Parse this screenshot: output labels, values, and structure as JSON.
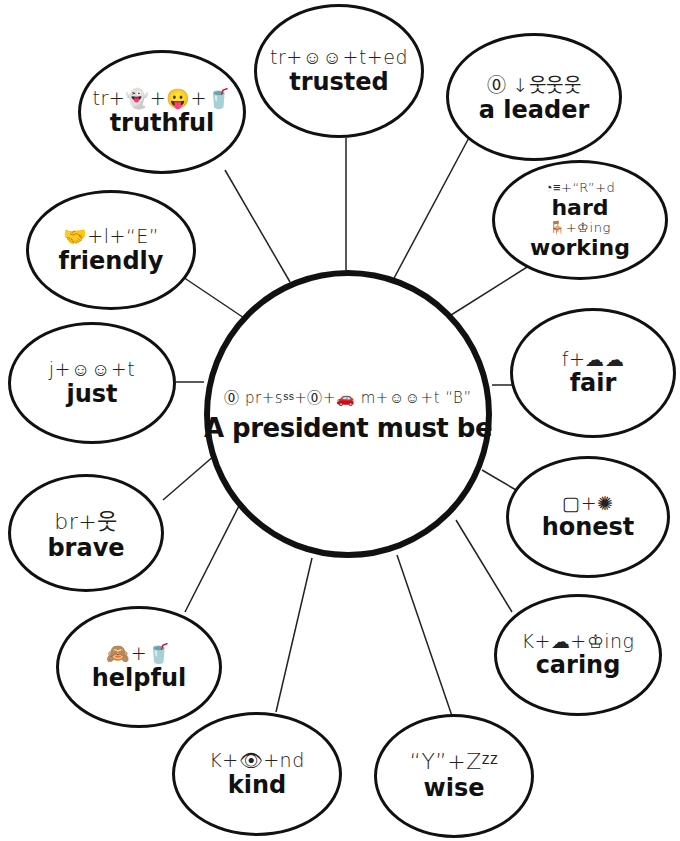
{
  "center": {
    "rebus": "⓪  pr+sˢˢ+⓪+🚗   m+☺☺+t  “B”",
    "title": "A president must be"
  },
  "bubbles": [
    {
      "id": "trusted",
      "rebus": "tr+☺☺+t+ed",
      "word": "trusted"
    },
    {
      "id": "truthful",
      "rebus": "tr+👻+😛+🥤",
      "word": "truthful"
    },
    {
      "id": "a-leader",
      "rebus": "⓪  ↓웃웃웃",
      "word": "a leader"
    },
    {
      "id": "hard-working",
      "rebus": "◔≡+“R”+d",
      "word": "hard",
      "rebus2": "🪑+♔ing",
      "word2": "working"
    },
    {
      "id": "friendly",
      "rebus": "🤝+l+“E”",
      "word": "friendly"
    },
    {
      "id": "just",
      "rebus": "j+☺☺+t",
      "word": "just"
    },
    {
      "id": "fair",
      "rebus": "f+☁☁",
      "word": "fair"
    },
    {
      "id": "brave",
      "rebus": "br+웃",
      "word": "brave"
    },
    {
      "id": "honest",
      "rebus": "▢+✺",
      "word": "honest"
    },
    {
      "id": "helpful",
      "rebus": "🙈+🥤",
      "word": "helpful"
    },
    {
      "id": "caring",
      "rebus": "K+☁+♔ing",
      "word": "caring"
    },
    {
      "id": "kind",
      "rebus": "K+👁+nd",
      "word": "kind"
    },
    {
      "id": "wise",
      "rebus": "“Y”+Zᶻᶻ",
      "word": "wise"
    }
  ],
  "colors": {
    "stroke": "#111111",
    "background": "#ffffff"
  }
}
